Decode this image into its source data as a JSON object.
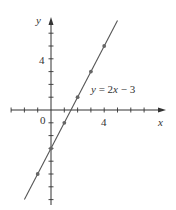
{
  "chart_data": {
    "type": "line",
    "title": "",
    "equation_label": "y = 2x − 3",
    "xlabel": "x",
    "ylabel": "y",
    "origin_label": "0",
    "x_tick_label": "4",
    "y_tick_label": "4",
    "xlim": [
      -3.5,
      6.5
    ],
    "ylim": [
      -7.5,
      8
    ],
    "grid": false,
    "series": [
      {
        "name": "y = 2x - 3",
        "line_x": [
          -2,
          5
        ],
        "line_y": [
          -7,
          7
        ],
        "points_x": [
          -1,
          0,
          1,
          2,
          3,
          4
        ],
        "points_y": [
          -5,
          -3,
          -1,
          1,
          3,
          5
        ]
      }
    ],
    "colors": {
      "axis": "#333333",
      "line": "#555555",
      "points": "#666666"
    }
  }
}
